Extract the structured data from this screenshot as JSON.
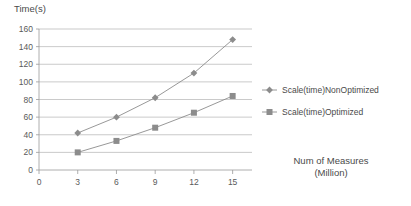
{
  "chart_data": {
    "type": "line",
    "title": "",
    "xlabel": "Num of Measures (Million)",
    "xlabel_line1": "Num of Measures",
    "xlabel_line2": "(Million)",
    "ylabel": "Time(s)",
    "x": [
      3,
      6,
      9,
      12,
      15
    ],
    "xticks": [
      0,
      3,
      6,
      9,
      12,
      15
    ],
    "yticks": [
      0,
      20,
      40,
      60,
      80,
      100,
      120,
      140,
      160
    ],
    "xlim": [
      0,
      16.5
    ],
    "ylim": [
      0,
      160
    ],
    "grid": "horizontal",
    "legend_position": "right",
    "series": [
      {
        "name": "Scale(time)NonOptimized",
        "marker": "diamond",
        "color": "#8c8c8c",
        "values": [
          42,
          60,
          82,
          110,
          148
        ]
      },
      {
        "name": "Scale(time)Optimized",
        "marker": "square",
        "color": "#8c8c8c",
        "values": [
          20,
          33,
          48,
          65,
          84
        ]
      }
    ]
  },
  "colors": {
    "grid": "#b3b3b3",
    "axis": "#9a9a9a",
    "series": "#8c8c8c",
    "text": "#4a4a4a",
    "background": "#ffffff"
  }
}
